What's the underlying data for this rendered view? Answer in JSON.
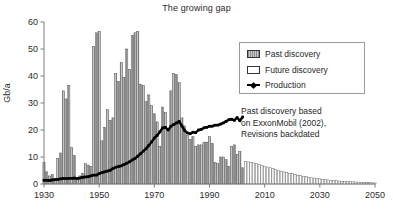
{
  "chart_data": {
    "type": "bar",
    "title": "The growing gap",
    "xlabel": "",
    "ylabel": "Gb/a",
    "xlim": [
      1930,
      2050
    ],
    "ylim": [
      0,
      60
    ],
    "xticks": [
      "1930",
      "1950",
      "1970",
      "1990",
      "2010",
      "2030",
      "2050"
    ],
    "yticks": [
      "0",
      "10",
      "20",
      "30",
      "40",
      "50",
      "60"
    ],
    "grid": false,
    "legend_position": "top-right",
    "legend": [
      {
        "label": "Past discovery",
        "style": "gray-hatched-bar"
      },
      {
        "label": "Future discovery",
        "style": "white-bar"
      },
      {
        "label": "Production",
        "style": "black-line-marker"
      }
    ],
    "annotation": {
      "line1": "Past discovery based",
      "line2": "on ExxonMobil (2002),",
      "line3": "Revisions backdated"
    },
    "series": [
      {
        "name": "Past discovery",
        "type": "bar",
        "fill": "gray",
        "x": [
          1930,
          1931,
          1932,
          1933,
          1934,
          1935,
          1936,
          1937,
          1938,
          1939,
          1940,
          1941,
          1942,
          1943,
          1944,
          1945,
          1946,
          1947,
          1948,
          1949,
          1950,
          1951,
          1952,
          1953,
          1954,
          1955,
          1956,
          1957,
          1958,
          1959,
          1960,
          1961,
          1962,
          1963,
          1964,
          1965,
          1966,
          1967,
          1968,
          1969,
          1970,
          1971,
          1972,
          1973,
          1974,
          1975,
          1976,
          1977,
          1978,
          1979,
          1980,
          1981,
          1982,
          1983,
          1984,
          1985,
          1986,
          1987,
          1988,
          1989,
          1990,
          1991,
          1992,
          1993,
          1994,
          1995,
          1996,
          1997,
          1998,
          1999,
          2000,
          2001,
          2002
        ],
        "values": [
          8.0,
          4.5,
          3.0,
          3.5,
          2.0,
          9.5,
          11.5,
          34.5,
          31.5,
          36.5,
          13.5,
          10.5,
          2.5,
          3.0,
          4.0,
          7.5,
          7.0,
          6.5,
          51.0,
          56.0,
          56.5,
          16.0,
          21.0,
          27.5,
          23.5,
          24.5,
          41.0,
          38.0,
          45.0,
          39.5,
          50.0,
          42.5,
          55.0,
          56.0,
          56.5,
          37.0,
          36.5,
          30.5,
          33.0,
          29.0,
          26.0,
          23.0,
          14.0,
          28.5,
          26.5,
          20.5,
          34.5,
          41.0,
          40.5,
          37.5,
          24.5,
          21.5,
          18.0,
          16.5,
          17.5,
          14.0,
          14.5,
          14.5,
          15.5,
          15.5,
          17.5,
          15.0,
          8.0,
          7.5,
          10.0,
          10.0,
          9.0,
          6.5,
          14.0,
          14.5,
          11.0,
          12.0,
          6.0
        ]
      },
      {
        "name": "Future discovery",
        "type": "bar",
        "fill": "white",
        "x": [
          2003,
          2004,
          2005,
          2006,
          2007,
          2008,
          2009,
          2010,
          2011,
          2012,
          2013,
          2014,
          2015,
          2016,
          2017,
          2018,
          2019,
          2020,
          2021,
          2022,
          2023,
          2024,
          2025,
          2026,
          2027,
          2028,
          2029,
          2030,
          2031,
          2032,
          2033,
          2034,
          2035,
          2036,
          2037,
          2038,
          2039,
          2040,
          2041,
          2042,
          2043,
          2044,
          2045,
          2046,
          2047,
          2048,
          2049,
          2050
        ],
        "values": [
          8.3,
          8.2,
          8.0,
          7.8,
          7.5,
          7.2,
          6.9,
          6.6,
          6.3,
          6.0,
          5.7,
          5.4,
          5.1,
          4.8,
          4.5,
          4.3,
          4.0,
          3.8,
          3.5,
          3.3,
          3.1,
          2.9,
          2.7,
          2.5,
          2.3,
          2.2,
          2.0,
          1.9,
          1.7,
          1.6,
          1.5,
          1.4,
          1.3,
          1.2,
          1.1,
          1.0,
          0.95,
          0.9,
          0.85,
          0.8,
          0.75,
          0.7,
          0.65,
          0.6,
          0.55,
          0.5,
          0.45,
          0.4
        ]
      },
      {
        "name": "Production",
        "type": "line",
        "color": "#000000",
        "x": [
          1930,
          1931,
          1932,
          1933,
          1934,
          1935,
          1936,
          1937,
          1938,
          1939,
          1940,
          1941,
          1942,
          1943,
          1944,
          1945,
          1946,
          1947,
          1948,
          1949,
          1950,
          1951,
          1952,
          1953,
          1954,
          1955,
          1956,
          1957,
          1958,
          1959,
          1960,
          1961,
          1962,
          1963,
          1964,
          1965,
          1966,
          1967,
          1968,
          1969,
          1970,
          1971,
          1972,
          1973,
          1974,
          1975,
          1976,
          1977,
          1978,
          1979,
          1980,
          1981,
          1982,
          1983,
          1984,
          1985,
          1986,
          1987,
          1988,
          1989,
          1990,
          1991,
          1992,
          1993,
          1994,
          1995,
          1996,
          1997,
          1998,
          1999,
          2000,
          2001,
          2002
        ],
        "values": [
          1.4,
          1.4,
          1.3,
          1.5,
          1.6,
          1.7,
          1.9,
          2.1,
          2.0,
          2.1,
          2.1,
          2.2,
          2.0,
          2.2,
          2.5,
          2.6,
          2.7,
          3.0,
          3.3,
          3.3,
          3.8,
          4.2,
          4.5,
          4.8,
          5.1,
          5.7,
          6.2,
          6.5,
          6.7,
          7.2,
          7.7,
          8.2,
          8.9,
          9.5,
          10.3,
          11.2,
          12.2,
          13.1,
          14.3,
          15.6,
          17.0,
          18.0,
          19.3,
          20.8,
          21.0,
          20.0,
          21.4,
          22.0,
          22.6,
          23.2,
          21.5,
          19.8,
          18.9,
          18.6,
          19.2,
          19.0,
          20.0,
          20.2,
          20.8,
          21.0,
          21.4,
          21.4,
          21.8,
          21.8,
          22.2,
          22.6,
          23.2,
          23.8,
          24.0,
          23.6,
          24.6,
          23.4,
          24.8
        ]
      }
    ]
  }
}
